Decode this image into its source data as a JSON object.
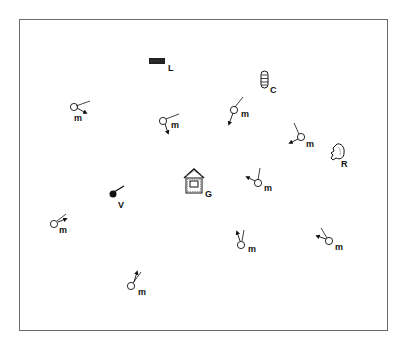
{
  "diagram": {
    "type": "environment-map",
    "frame": {
      "x": 19,
      "y": 19,
      "width": 369,
      "height": 312,
      "stroke": "#6a6a6a"
    },
    "landmarks": [
      {
        "id": "L",
        "label": "L",
        "shape": "filled-bar",
        "x": 157,
        "y": 61,
        "label_x": 168,
        "label_y": 70
      },
      {
        "id": "C",
        "label": "C",
        "shape": "segmented-capsule",
        "x": 264,
        "y": 80,
        "label_x": 270,
        "label_y": 92
      },
      {
        "id": "R",
        "label": "R",
        "shape": "rock",
        "x": 337,
        "y": 152,
        "label_x": 341,
        "label_y": 167
      },
      {
        "id": "G",
        "label": "G",
        "shape": "brick-house",
        "x": 194,
        "y": 181,
        "label_x": 205,
        "label_y": 197
      },
      {
        "id": "V",
        "label": "V",
        "shape": "filled-dot-with-stick",
        "x": 113,
        "y": 194,
        "label_x": 118,
        "label_y": 207
      }
    ],
    "agents": [
      {
        "label": "m",
        "cx": 74,
        "cy": 107,
        "line": [
          77,
          108,
          90,
          102
        ],
        "arrow": [
          78,
          108,
          87,
          113
        ],
        "label_x": 74,
        "label_y": 120
      },
      {
        "label": "m",
        "cx": 163,
        "cy": 121,
        "line": [
          166,
          119,
          179,
          114
        ],
        "arrow": [
          165,
          124,
          169,
          134
        ],
        "label_x": 171,
        "label_y": 128
      },
      {
        "label": "m",
        "cx": 234,
        "cy": 110,
        "line": [
          235,
          107,
          243,
          97
        ],
        "arrow": [
          233,
          114,
          229,
          125
        ],
        "label_x": 241,
        "label_y": 117
      },
      {
        "label": "m",
        "cx": 301,
        "cy": 137,
        "line": [
          299,
          134,
          294,
          123
        ],
        "arrow": [
          298,
          140,
          289,
          144
        ],
        "label_x": 306,
        "label_y": 147
      },
      {
        "label": "m",
        "cx": 258,
        "cy": 183,
        "line": [
          258,
          180,
          260,
          168
        ],
        "arrow": [
          255,
          181,
          246,
          177
        ],
        "label_x": 264,
        "label_y": 191
      },
      {
        "label": "m",
        "cx": 54,
        "cy": 224,
        "line": [
          57,
          221,
          66,
          214
        ],
        "arrow": [
          58,
          222,
          67,
          219
        ],
        "label_x": 59,
        "label_y": 233
      },
      {
        "label": "m",
        "cx": 241,
        "cy": 245,
        "line": [
          242,
          242,
          244,
          230
        ],
        "arrow": [
          240,
          242,
          237,
          231
        ],
        "label_x": 248,
        "label_y": 252
      },
      {
        "label": "m",
        "cx": 329,
        "cy": 241,
        "line": [
          327,
          238,
          321,
          228
        ],
        "arrow": [
          326,
          239,
          316,
          236
        ],
        "label_x": 335,
        "label_y": 250
      },
      {
        "label": "m",
        "cx": 131,
        "cy": 286,
        "line": [
          133,
          283,
          141,
          272
        ],
        "arrow": [
          134,
          282,
          137,
          271
        ],
        "label_x": 138,
        "label_y": 294
      }
    ],
    "colors": {
      "ink": "#111111",
      "background": "#ffffff"
    }
  }
}
